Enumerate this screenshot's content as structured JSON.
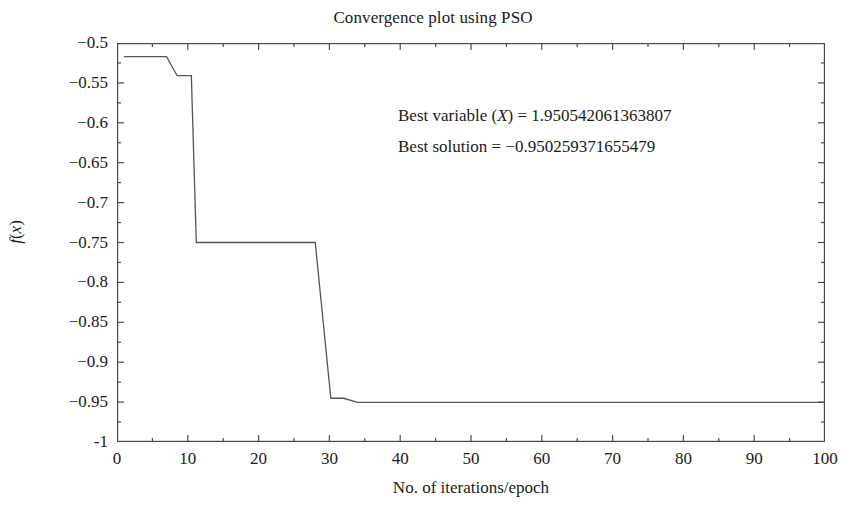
{
  "chart_data": {
    "type": "line",
    "title": "Convergence plot using PSO",
    "xlabel": "No. of iterations/epoch",
    "ylabel": "f(x)",
    "xlim": [
      0,
      100
    ],
    "ylim": [
      -1,
      -0.5
    ],
    "grid": false,
    "legend": null,
    "xticks": [
      "0",
      "10",
      "20",
      "30",
      "40",
      "50",
      "60",
      "70",
      "80",
      "90",
      "100"
    ],
    "xtick_values": [
      0,
      10,
      20,
      30,
      40,
      50,
      60,
      70,
      80,
      90,
      100
    ],
    "yticks": [
      "-0.5",
      "-0.55",
      "-0.6",
      "-0.65",
      "-0.7",
      "-0.75",
      "-0.8",
      "-0.85",
      "-0.9",
      "-0.95",
      "-1"
    ],
    "ytick_values": [
      -0.5,
      -0.55,
      -0.6,
      -0.65,
      -0.7,
      -0.75,
      -0.8,
      -0.85,
      -0.9,
      -0.95,
      -1
    ],
    "line_color": "#555555",
    "x": [
      1,
      7,
      8.5,
      10.5,
      11.2,
      28,
      30.2,
      32,
      34,
      100
    ],
    "y": [
      -0.517,
      -0.517,
      -0.541,
      -0.541,
      -0.75,
      -0.75,
      -0.9452,
      -0.9452,
      -0.9503,
      -0.9503
    ],
    "series": [
      {
        "name": "best cost per iteration",
        "x": [
          1,
          7,
          8.5,
          10.5,
          11.2,
          28,
          30.2,
          32,
          34,
          100
        ],
        "values": [
          -0.517,
          -0.517,
          -0.541,
          -0.541,
          -0.75,
          -0.75,
          -0.9452,
          -0.9452,
          -0.9503,
          -0.9503
        ]
      }
    ],
    "annotations": [
      {
        "id": "best-variable",
        "prefix": "Best variable (",
        "variable": "X",
        "suffix": ") = ",
        "value": "1.950542061363807",
        "text": "Best variable (X) = 1.950542061363807"
      },
      {
        "id": "best-solution",
        "prefix": "Best solution = ",
        "value": "−0.950259371655479",
        "text": "Best solution = −0.950259371655479"
      }
    ]
  },
  "figure": {
    "title": "Convergence plot using PSO",
    "xlabel": "No. of iterations/epoch",
    "ylabel_f": "f",
    "ylabel_open": "(",
    "ylabel_x": "x",
    "ylabel_close": ")",
    "axis_color": "#4a4a4a",
    "background": "#ffffff"
  }
}
